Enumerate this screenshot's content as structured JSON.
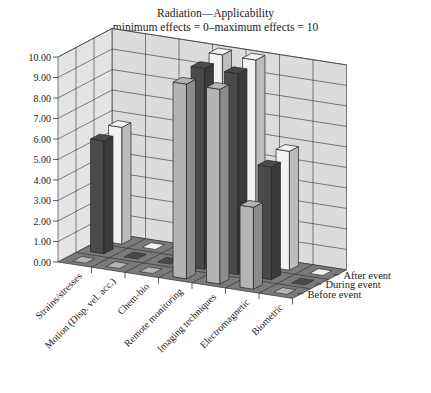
{
  "chart_data": {
    "type": "bar",
    "subtype": "3d-column",
    "title": "Radiation—Applicability",
    "subtitle": "minimum effects = 0–maximum effects = 10",
    "xlabel": "",
    "ylabel": "",
    "ylim": [
      0,
      10
    ],
    "yticks": [
      "0.00",
      "1.00",
      "2.00",
      "3.00",
      "4.00",
      "5.00",
      "6.00",
      "7.00",
      "8.00",
      "9.00",
      "10.00"
    ],
    "grid": true,
    "legend_position": "depth-axis-right",
    "categories": [
      "Strains/stresses",
      "Motion (Disp. vel. acc.)",
      "Chem-bio",
      "Remote monitoring",
      "Imaging techniques",
      "Electromagnetic",
      "Biometric"
    ],
    "series": [
      {
        "name": "Before event",
        "color": "#b4b4b4",
        "values": [
          0,
          0,
          0,
          9.5,
          9.5,
          4.0,
          0
        ]
      },
      {
        "name": "During event",
        "color": "#4a4a4a",
        "values": [
          5.5,
          0,
          0,
          9.8,
          9.8,
          5.5,
          0
        ]
      },
      {
        "name": "After event",
        "color": "#f2f2f2",
        "values": [
          5.7,
          0,
          0,
          10.0,
          10.0,
          5.8,
          0
        ]
      }
    ]
  },
  "colors": {
    "wall": "#dcdcdc",
    "floor": "#7a7a7a",
    "grid": "#333333"
  }
}
